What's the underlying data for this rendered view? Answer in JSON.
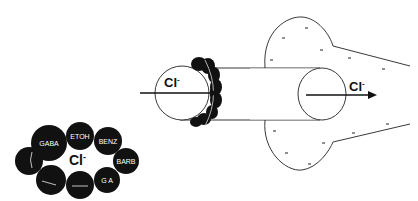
{
  "diagram": {
    "ion_label": "Cl-",
    "ion_label_left": "Cl",
    "ion_sup": "-",
    "receptor_cluster": {
      "center_label": "Cl",
      "center_sup": "-",
      "subunits": [
        {
          "label": "GABA",
          "cx": 49,
          "cy": 143,
          "r": 18
        },
        {
          "label": "ETOH",
          "cx": 80,
          "cy": 136,
          "r": 14
        },
        {
          "label": "BENZ",
          "cx": 108,
          "cy": 141,
          "r": 14
        },
        {
          "label": "BARB",
          "cx": 126,
          "cy": 161,
          "r": 13
        },
        {
          "label": "G A",
          "cx": 107,
          "cy": 180,
          "r": 13
        },
        {
          "label": "",
          "cx": 80,
          "cy": 185,
          "r": 14
        },
        {
          "label": "",
          "cx": 51,
          "cy": 180,
          "r": 15
        },
        {
          "label": "",
          "cx": 29,
          "cy": 161,
          "r": 14
        }
      ]
    },
    "channel": {
      "entry_label": "Cl",
      "exit_label": "Cl",
      "sup": "-"
    },
    "colors": {
      "ink": "#111111",
      "background": "#ffffff"
    }
  }
}
